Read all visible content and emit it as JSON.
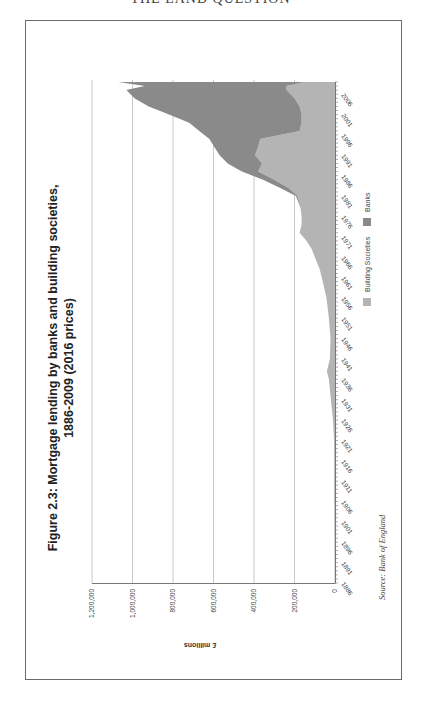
{
  "page": {
    "running_head": "THE LAND QUESTION"
  },
  "figure": {
    "title_line1": "Figure 2.3: Mortgage lending by banks and building societies,",
    "title_line2": "1886-2009 (2016 prices)",
    "source": "Source: Bank of England",
    "orientation": "rotated 90° counter-clockwise on page"
  },
  "chart_data": {
    "type": "area",
    "stacked": true,
    "xlabel": "",
    "ylabel": "£ millions",
    "ylim": [
      0,
      1200000
    ],
    "yticks": [
      0,
      200000,
      400000,
      600000,
      800000,
      1000000,
      1200000
    ],
    "ytick_labels": [
      "0",
      "200,000",
      "400,000",
      "600,000",
      "800,000",
      "1,000,000",
      "1,200,000"
    ],
    "xlim": [
      1886,
      2009
    ],
    "xtick_labels": [
      "1886",
      "1891",
      "1896",
      "1901",
      "1906",
      "1911",
      "1916",
      "1921",
      "1926",
      "1931",
      "1936",
      "1941",
      "1946",
      "1951",
      "1956",
      "1961",
      "1966",
      "1971",
      "1976",
      "1981",
      "1986",
      "1991",
      "1996",
      "2001",
      "2006"
    ],
    "grid": "horizontal gridlines at y ticks",
    "legend": {
      "position": "bottom",
      "entries": [
        {
          "name": "Building Societies",
          "color": "#b4b4b4"
        },
        {
          "name": "Banks",
          "color": "#8a8a8a"
        }
      ]
    },
    "x": [
      1886,
      1891,
      1896,
      1901,
      1906,
      1911,
      1916,
      1921,
      1926,
      1931,
      1936,
      1938,
      1941,
      1946,
      1951,
      1956,
      1961,
      1963,
      1966,
      1968,
      1970,
      1972,
      1974,
      1976,
      1978,
      1980,
      1981,
      1983,
      1985,
      1987,
      1989,
      1991,
      1993,
      1995,
      1997,
      1999,
      2001,
      2003,
      2005,
      2007,
      2008,
      2009
    ],
    "series": [
      {
        "name": "Building Societies",
        "color": "#b4b4b4",
        "values": [
          2000,
          2500,
          3000,
          3500,
          4000,
          4500,
          4000,
          5000,
          10000,
          20000,
          30000,
          40000,
          25000,
          22000,
          30000,
          42000,
          65000,
          75000,
          100000,
          115000,
          140000,
          175000,
          165000,
          165000,
          170000,
          180000,
          185000,
          230000,
          300000,
          380000,
          360000,
          395000,
          380000,
          370000,
          175000,
          165000,
          165000,
          175000,
          200000,
          240000,
          240000,
          150000
        ]
      },
      {
        "name": "Banks",
        "color": "#8a8a8a",
        "values": [
          0,
          0,
          0,
          0,
          0,
          0,
          0,
          0,
          0,
          0,
          0,
          0,
          0,
          0,
          0,
          0,
          0,
          0,
          0,
          0,
          0,
          0,
          0,
          0,
          0,
          5000,
          8000,
          40000,
          55000,
          80000,
          170000,
          175000,
          215000,
          250000,
          495000,
          555000,
          655000,
          745000,
          790000,
          790000,
          700000,
          920000
        ]
      }
    ]
  }
}
